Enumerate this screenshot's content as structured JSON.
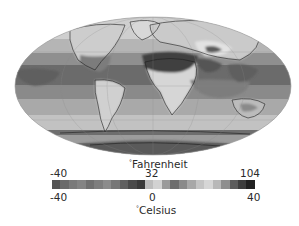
{
  "map": {
    "projection": "Mollweide (world)",
    "subject": "Global surface temperature",
    "palette": "grayscale"
  },
  "legend": {
    "fahrenheit_label": "Fahrenheit",
    "fahrenheit_degree": "°",
    "fahrenheit_ticks": [
      "-40",
      "32",
      "104"
    ],
    "celsius_label": "Celsius",
    "celsius_degree": "°",
    "celsius_ticks": [
      "-40",
      "0",
      "40"
    ],
    "color_steps": [
      "#555555",
      "#6a6a6a",
      "#7a7a7a",
      "#848484",
      "#707070",
      "#7e7e7e",
      "#8c8c8c",
      "#777777",
      "#606060",
      "#4a4a4a",
      "#3a3a3a",
      "#bdbdbd",
      "#d2d2d2",
      "#9a9a9a",
      "#6e6e6e",
      "#8a8a8a",
      "#a8a8a8",
      "#c4c4c4",
      "#d6d6d6",
      "#b8b8b8",
      "#8e8e8e",
      "#5c5c5c",
      "#3e3e3e",
      "#222222"
    ]
  }
}
